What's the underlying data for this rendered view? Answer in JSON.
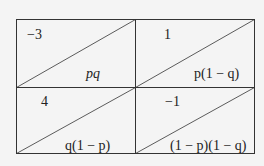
{
  "diagram": {
    "type": "payoff-probability-grid",
    "cells": [
      {
        "position": "top-left",
        "payoff": "−3",
        "probability": "pq"
      },
      {
        "position": "top-right",
        "payoff": "1",
        "probability": "p(1 − q)"
      },
      {
        "position": "bottom-left",
        "payoff": "4",
        "probability": "q(1 − p)"
      },
      {
        "position": "bottom-right",
        "payoff": "−1",
        "probability": "(1 − p)(1 − q)"
      }
    ],
    "colors": {
      "background": "#f4f4f4",
      "line": "#333333",
      "text": "#222222"
    }
  }
}
